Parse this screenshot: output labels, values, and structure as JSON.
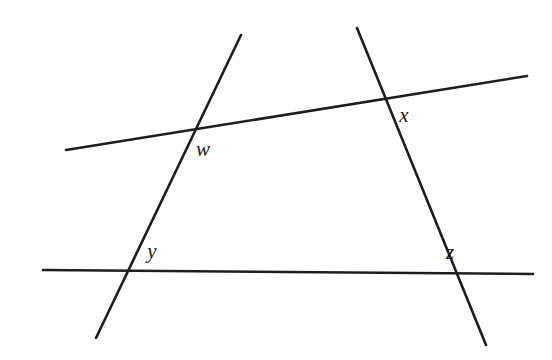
{
  "figure": {
    "background_color": "#ffffff",
    "line_color": "#1d1d1d",
    "label_color": "#1b1b1b",
    "width": 552,
    "height": 360
  },
  "chart_data": {
    "type": "diagram",
    "xlabel": "",
    "ylabel": "",
    "xlim": [
      0,
      552
    ],
    "ylim": [
      0,
      360
    ],
    "grid": false,
    "legend": "none",
    "lines": [
      {
        "name": "horizontal-baseline",
        "description": "Nearly horizontal line across the lower portion",
        "x1": 43,
        "y1": 270,
        "x2": 533,
        "y2": 274
      },
      {
        "name": "upper-transversal",
        "description": "Gently upward-sloping transversal across the upper portion",
        "x1": 66,
        "y1": 150,
        "x2": 527,
        "y2": 76
      },
      {
        "name": "left-steep-line",
        "description": "Steep line rising left-to-right through w and y",
        "x1": 96,
        "y1": 338,
        "x2": 241,
        "y2": 35
      },
      {
        "name": "right-steep-line",
        "description": "Steep line falling left-to-right through x and z",
        "x1": 357,
        "y1": 28,
        "x2": 486,
        "y2": 345
      }
    ],
    "intersections": [
      {
        "label": "w",
        "x": 193,
        "y": 128,
        "label_x": 203,
        "label_y": 151,
        "lines": [
          "upper-transversal",
          "left-steep-line"
        ]
      },
      {
        "label": "x",
        "x": 392,
        "y": 101,
        "label_x": 404,
        "label_y": 117,
        "lines": [
          "upper-transversal",
          "right-steep-line"
        ]
      },
      {
        "label": "y",
        "x": 130,
        "y": 272,
        "label_x": 152,
        "label_y": 253,
        "lines": [
          "horizontal-baseline",
          "left-steep-line"
        ]
      },
      {
        "label": "z",
        "x": 431,
        "y": 273,
        "label_x": 450,
        "label_y": 254,
        "lines": [
          "horizontal-baseline",
          "right-steep-line"
        ]
      }
    ]
  }
}
